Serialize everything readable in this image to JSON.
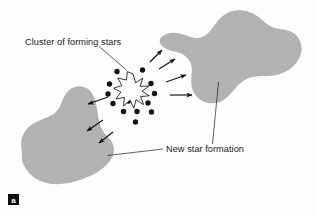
{
  "figure": {
    "panel_label": "a",
    "background_color": "#fdfdfd",
    "galaxy_fill_color": "#b2b2b2",
    "ink_color": "#141414"
  },
  "labels": {
    "cluster": "Cluster of forming stars",
    "new_star_formation": "New star formation"
  },
  "chart_data": {
    "type": "diagram",
    "elements": {
      "galaxies": [
        {
          "name": "left-galaxy",
          "position": "lower-left",
          "fill": "#b2b2b2"
        },
        {
          "name": "right-galaxy",
          "position": "upper-right",
          "fill": "#b2b2b2"
        }
      ],
      "star_cluster": {
        "name": "central-star-cluster",
        "dot_count": 14,
        "starburst_points": 9
      },
      "arrows_toward_left_galaxy": 3,
      "arrows_toward_right_galaxy": 4
    },
    "annotations": [
      {
        "text": "Cluster of forming stars",
        "points_to": "central-star-cluster"
      },
      {
        "text": "New star formation",
        "points_to": "left-galaxy and right-galaxy"
      }
    ]
  },
  "geometry": {
    "left_galaxy_path": "M 21.5 148.5 C 20.0 140.0 23.0 131.5 30.0 126.0 C 37.0 120.5 45.5 118.5 52.0 115.0 C 57.5 112.0 60.0 107.0 62.0 101.5 C 64.5 95.0 68.0 89.5 74.0 87.2 C 80.5 84.8 87.5 87.0 91.5 92.5 C 95.5 98.0 96.5 105.0 97.5 112.0 C 98.5 119.0 99.5 125.5 103.0 131.0 C 106.5 136.5 112.0 140.0 113.5 146.0 C 115.2 152.5 112.0 159.5 106.5 165.0 C 100.0 171.5 90.5 176.5 80.0 180.0 C 69.0 183.7 57.0 185.5 46.5 183.0 C 36.0 180.5 27.5 173.5 23.5 164.5 C 21.0 159.0 22.2 153.5 21.5 148.5 Z",
    "right_galaxy_path": "M 161.5 37.0 C 166.5 33.0 173.0 32.0 179.5 33.5 C 186.0 35.0 192.0 38.5 198.0 38.0 C 204.0 37.5 208.5 33.5 212.5 28.0 C 217.0 21.5 222.0 15.0 229.5 12.0 C 237.5 8.8 247.0 10.0 254.0 14.0 C 260.5 17.7 265.0 23.5 271.0 26.5 C 277.0 29.5 284.5 29.0 290.5 31.5 C 297.0 34.2 301.0 40.0 301.5 47.0 C 302.0 54.5 298.5 61.5 293.0 66.5 C 287.5 71.5 280.5 74.5 273.5 75.5 C 266.0 76.6 258.5 75.5 252.0 77.0 C 245.5 78.5 240.5 82.5 236.0 87.5 C 231.5 92.5 227.5 98.0 222.0 101.0 C 216.0 104.2 208.5 104.0 202.5 101.0 C 196.5 98.0 192.5 92.0 191.5 85.5 C 190.5 79.0 192.5 72.5 191.5 66.5 C 190.5 60.5 186.5 56.0 181.0 53.5 C 175.5 51.0 169.0 51.0 164.5 48.0 C 160.0 45.0 158.0 40.2 161.5 37.0 Z",
    "starburst_path": "M 133.0 74.0 L 135.6 82.8 L 142.8 78.2 L 140.2 86.4 L 149.0 86.0 L 142.0 91.2 L 149.2 95.8 L 140.6 96.6 L 143.6 104.6 L 136.0 99.8 L 133.8 108.2 L 130.0 100.2 L 123.6 106.0 L 124.4 97.4 L 116.0 99.0 L 120.8 92.0 L 113.6 88.2 L 121.8 85.6 L 117.8 78.0 L 126.4 80.0 L 127.4 71.6 Z",
    "cluster_dots": [
      {
        "cx": 117.0,
        "cy": 71.5,
        "r": 2.7
      },
      {
        "cx": 142.5,
        "cy": 70.0,
        "r": 2.7
      },
      {
        "cx": 131.0,
        "cy": 76.5,
        "r": 2.7
      },
      {
        "cx": 109.5,
        "cy": 84.0,
        "r": 2.7
      },
      {
        "cx": 151.0,
        "cy": 83.5,
        "r": 2.7
      },
      {
        "cx": 108.0,
        "cy": 94.0,
        "r": 2.7
      },
      {
        "cx": 154.5,
        "cy": 93.5,
        "r": 2.7
      },
      {
        "cx": 113.0,
        "cy": 103.5,
        "r": 2.7
      },
      {
        "cx": 128.5,
        "cy": 101.0,
        "r": 2.7
      },
      {
        "cx": 148.0,
        "cy": 103.0,
        "r": 2.7
      },
      {
        "cx": 123.5,
        "cy": 111.5,
        "r": 2.7
      },
      {
        "cx": 137.0,
        "cy": 111.5,
        "r": 2.7
      },
      {
        "cx": 151.5,
        "cy": 112.0,
        "r": 2.7
      },
      {
        "cx": 135.5,
        "cy": 122.0,
        "r": 2.7
      }
    ],
    "arrows_left": [
      {
        "x1": 108.0,
        "y1": 97.0,
        "x2": 88.0,
        "y2": 104.0
      },
      {
        "x1": 103.0,
        "y1": 120.0,
        "x2": 87.0,
        "y2": 131.0
      },
      {
        "x1": 113.0,
        "y1": 132.0,
        "x2": 99.0,
        "y2": 143.0
      }
    ],
    "arrows_right": [
      {
        "x1": 150.0,
        "y1": 62.0,
        "x2": 162.0,
        "y2": 50.0
      },
      {
        "x1": 159.0,
        "y1": 69.0,
        "x2": 175.0,
        "y2": 59.0
      },
      {
        "x1": 166.0,
        "y1": 82.0,
        "x2": 186.0,
        "y2": 75.0
      },
      {
        "x1": 170.0,
        "y1": 95.0,
        "x2": 192.0,
        "y2": 95.0
      }
    ]
  }
}
